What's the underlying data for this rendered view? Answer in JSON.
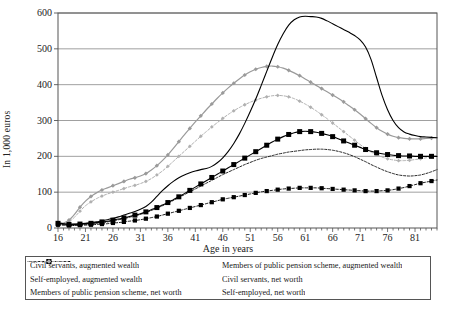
{
  "axes": {
    "ylabel": "In 1,000 euros",
    "xlabel": "Age in years",
    "yticks": [
      "0",
      "100",
      "200",
      "300",
      "400",
      "500",
      "600"
    ],
    "xticks": [
      "16",
      "21",
      "26",
      "31",
      "36",
      "41",
      "46",
      "51",
      "56",
      "61",
      "66",
      "71",
      "76",
      "81"
    ]
  },
  "legend": {
    "items": [
      {
        "label": "Civil servants, augmented wealth",
        "style": "solid-black"
      },
      {
        "label": "Members of public pension scheme, augmented wealth",
        "style": "solid-black-squares"
      },
      {
        "label": "Self-employed, augmented wealth",
        "style": "solid-gray-markers"
      },
      {
        "label": "Civil servants, net worth",
        "style": "dashed-black"
      },
      {
        "label": "Members of public pension scheme, net worth",
        "style": "dashed-black-squares"
      },
      {
        "label": "Self-employed, net worth",
        "style": "dashed-gray-markers"
      }
    ]
  },
  "chart_data": {
    "type": "line",
    "title": "",
    "xlabel": "Age in years",
    "ylabel": "In 1,000 euros",
    "xlim": [
      16,
      85
    ],
    "ylim": [
      0,
      600
    ],
    "grid": true,
    "legend_position": "bottom",
    "x": [
      16,
      17,
      18,
      19,
      20,
      21,
      22,
      23,
      24,
      25,
      26,
      27,
      28,
      29,
      30,
      31,
      32,
      33,
      34,
      35,
      36,
      37,
      38,
      39,
      40,
      41,
      42,
      43,
      44,
      45,
      46,
      47,
      48,
      49,
      50,
      51,
      52,
      53,
      54,
      55,
      56,
      57,
      58,
      59,
      60,
      61,
      62,
      63,
      64,
      65,
      66,
      67,
      68,
      69,
      70,
      71,
      72,
      73,
      74,
      75,
      76,
      77,
      78,
      79,
      80,
      81,
      82,
      83,
      84,
      85
    ],
    "series": [
      {
        "name": "Civil servants, augmented wealth",
        "color": "#000000",
        "values": [
          14,
          12,
          11,
          11,
          12,
          13,
          15,
          17,
          20,
          23,
          27,
          31,
          36,
          41,
          46,
          52,
          60,
          72,
          88,
          104,
          118,
          130,
          140,
          148,
          154,
          159,
          163,
          166,
          172,
          182,
          196,
          214,
          236,
          262,
          292,
          325,
          360,
          398,
          437,
          476,
          512,
          542,
          566,
          581,
          589,
          591,
          590,
          589,
          585,
          578,
          570,
          562,
          554,
          546,
          537,
          525,
          505,
          470,
          420,
          370,
          330,
          300,
          280,
          268,
          262,
          258,
          255,
          254,
          253,
          252
        ]
      },
      {
        "name": "Self-employed, augmented wealth",
        "color": "#9a9a9a",
        "values": [
          12,
          14,
          22,
          38,
          58,
          75,
          88,
          98,
          106,
          112,
          118,
          124,
          130,
          136,
          140,
          145,
          152,
          162,
          174,
          188,
          204,
          222,
          241,
          260,
          278,
          296,
          313,
          330,
          346,
          362,
          377,
          391,
          404,
          416,
          427,
          436,
          443,
          448,
          451,
          452,
          450,
          446,
          440,
          433,
          425,
          416,
          407,
          398,
          389,
          380,
          371,
          362,
          352,
          341,
          330,
          318,
          305,
          292,
          280,
          270,
          262,
          256,
          252,
          250,
          249,
          249,
          249,
          250,
          251,
          252
        ]
      },
      {
        "name": "Members of public pension scheme, augmented wealth",
        "color": "#000000",
        "values": [
          13,
          11,
          10,
          10,
          11,
          12,
          13,
          15,
          17,
          19,
          22,
          25,
          28,
          32,
          36,
          40,
          45,
          51,
          57,
          64,
          71,
          79,
          87,
          96,
          105,
          114,
          123,
          132,
          141,
          150,
          159,
          168,
          177,
          186,
          195,
          204,
          213,
          222,
          231,
          240,
          248,
          255,
          261,
          266,
          269,
          270,
          269,
          267,
          264,
          260,
          255,
          249,
          243,
          237,
          231,
          225,
          219,
          214,
          210,
          207,
          205,
          203,
          202,
          201,
          201,
          200,
          200,
          200,
          200,
          200
        ]
      },
      {
        "name": "Civil servants, net worth",
        "color": "#000000",
        "values": [
          10,
          9,
          8,
          8,
          9,
          10,
          11,
          13,
          15,
          17,
          20,
          23,
          26,
          30,
          34,
          38,
          43,
          49,
          55,
          62,
          69,
          77,
          85,
          93,
          101,
          109,
          117,
          125,
          133,
          141,
          149,
          156,
          163,
          170,
          177,
          183,
          189,
          194,
          198,
          202,
          206,
          209,
          212,
          214,
          216,
          218,
          219,
          220,
          220,
          219,
          217,
          214,
          210,
          205,
          199,
          192,
          185,
          177,
          170,
          163,
          157,
          152,
          148,
          146,
          145,
          146,
          148,
          152,
          157,
          163
        ]
      },
      {
        "name": "Self-employed, net worth",
        "color": "#9a9a9a",
        "values": [
          10,
          11,
          17,
          30,
          47,
          62,
          73,
          82,
          89,
          95,
          100,
          105,
          110,
          115,
          119,
          124,
          130,
          138,
          148,
          159,
          172,
          186,
          200,
          214,
          228,
          242,
          256,
          269,
          282,
          294,
          306,
          317,
          327,
          336,
          344,
          351,
          357,
          362,
          366,
          369,
          370,
          369,
          366,
          361,
          354,
          346,
          337,
          327,
          316,
          305,
          293,
          281,
          269,
          257,
          245,
          233,
          222,
          212,
          204,
          198,
          193,
          190,
          188,
          188,
          189,
          191,
          193,
          196,
          199,
          202
        ]
      },
      {
        "name": "Members of public pension scheme, net worth",
        "color": "#000000",
        "values": [
          9,
          8,
          7,
          7,
          8,
          8,
          9,
          10,
          11,
          12,
          14,
          15,
          17,
          19,
          21,
          23,
          26,
          29,
          32,
          36,
          40,
          44,
          48,
          52,
          56,
          60,
          64,
          68,
          72,
          76,
          80,
          83,
          86,
          89,
          92,
          95,
          98,
          101,
          103,
          105,
          107,
          109,
          110,
          111,
          112,
          112,
          112,
          112,
          111,
          110,
          109,
          108,
          107,
          106,
          105,
          104,
          103,
          103,
          103,
          104,
          105,
          107,
          110,
          113,
          117,
          121,
          125,
          128,
          131,
          134
        ]
      }
    ]
  }
}
